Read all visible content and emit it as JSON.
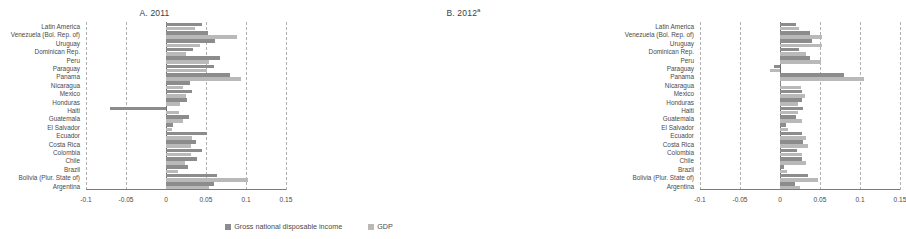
{
  "figure": {
    "legend": [
      {
        "key": "gndi",
        "label": "Gross national disposable income",
        "color": "#8c8c8c"
      },
      {
        "key": "gdp",
        "label": "GDP",
        "color": "#b9b9b9"
      }
    ]
  },
  "chart_data": {
    "type": "bar",
    "orientation": "horizontal",
    "title": "",
    "xlabel": "",
    "ylabel": "",
    "xlim": [
      -0.1,
      0.15
    ],
    "xticks": [
      "-0.1",
      "-0.05",
      "0",
      "0.05",
      "0.1",
      "0.15"
    ],
    "xtick_values": [
      -0.1,
      -0.05,
      0,
      0.05,
      0.1,
      0.15
    ],
    "grid": true,
    "legend_position": "bottom-center",
    "categories": [
      "Latin America",
      "Venezuela (Bol. Rep. of)",
      "Uruguay",
      "Dominican Rep.",
      "Peru",
      "Paraguay",
      "Panama",
      "Nicaragua",
      "Mexico",
      "Honduras",
      "Haiti",
      "Guatemala",
      "El Salvador",
      "Ecuador",
      "Costa Rica",
      "Colombia",
      "Chile",
      "Brazil",
      "Bolivia (Plur. State of)",
      "Argentina"
    ],
    "panels": [
      {
        "id": "A",
        "title": "A. 2011",
        "title_superscript": "",
        "series": [
          {
            "name": "Gross national disposable income",
            "key": "gndi",
            "values": [
              0.045,
              0.053,
              0.061,
              0.034,
              0.068,
              0.06,
              0.08,
              0.03,
              0.033,
              0.026,
              -0.07,
              0.029,
              0.009,
              0.051,
              0.037,
              0.045,
              0.039,
              0.027,
              0.064,
              0.06
            ]
          },
          {
            "name": "GDP",
            "key": "gdp",
            "values": [
              0.036,
              0.089,
              0.042,
              0.025,
              0.054,
              0.051,
              0.094,
              0.021,
              0.025,
              0.017,
              0.016,
              0.021,
              0.008,
              0.033,
              0.031,
              0.031,
              0.024,
              0.015,
              0.102,
              0.054
            ]
          }
        ]
      },
      {
        "id": "B",
        "title": "B. 2012",
        "title_superscript": "a",
        "series": [
          {
            "name": "Gross national disposable income",
            "key": "gndi",
            "values": [
              0.02,
              0.038,
              0.04,
              0.024,
              0.037,
              -0.008,
              0.08,
              0.001,
              0.028,
              0.027,
              0.029,
              0.02,
              0.007,
              0.028,
              0.029,
              0.021,
              0.028,
              0.005,
              0.035,
              0.019
            ]
          },
          {
            "name": "GDP",
            "key": "gdp",
            "values": [
              0.024,
              0.052,
              0.052,
              0.033,
              0.051,
              -0.013,
              0.105,
              0.026,
              0.031,
              0.022,
              0.022,
              0.028,
              0.01,
              0.032,
              0.035,
              0.027,
              0.032,
              0.009,
              0.047,
              0.025
            ]
          }
        ]
      }
    ]
  }
}
